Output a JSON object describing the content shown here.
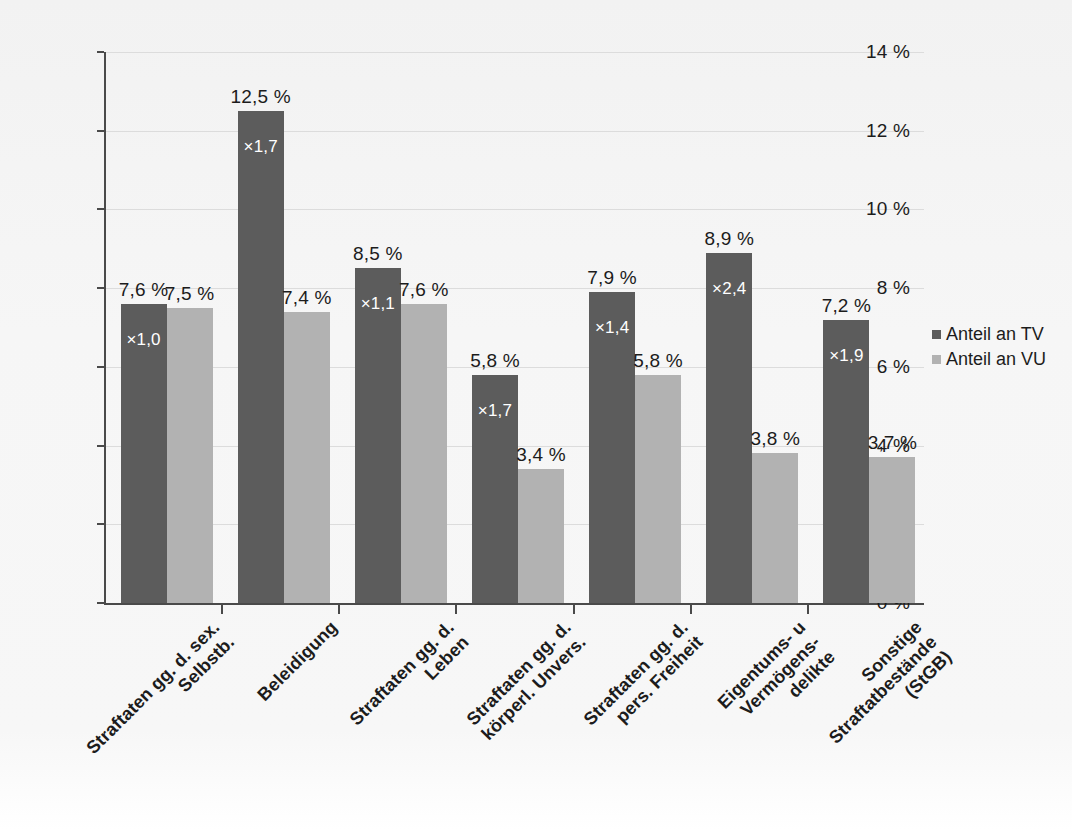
{
  "chart_data": {
    "type": "bar",
    "title": "",
    "subtitle": "",
    "xlabel": "",
    "ylabel": "",
    "ylim": [
      0,
      14
    ],
    "ytick_labels": [
      "0 %",
      "2 %",
      "4 %",
      "6 %",
      "8 %",
      "10 %",
      "12 %",
      "14 %"
    ],
    "ytick_values": [
      0,
      2,
      4,
      6,
      8,
      10,
      12,
      14
    ],
    "grid": true,
    "legend_position": "right",
    "value_suffix": " %",
    "categories": [
      [
        "Straftaten gg. d. sex.",
        "Selbstb."
      ],
      [
        "Beleidigung"
      ],
      [
        "Straftaten gg. d.",
        "Leben"
      ],
      [
        "Straftaten gg. d.",
        "körperl. Unvers."
      ],
      [
        "Straftaten gg. d.",
        "pers. Freiheit"
      ],
      [
        "Eigentums- u",
        "Vermögens-",
        "delikte"
      ],
      [
        "Sonstige",
        "Straftatbestände",
        "(StGB)"
      ]
    ],
    "series": [
      {
        "name": "Anteil an TV",
        "color": "#5c5c5c",
        "values": [
          7.6,
          12.5,
          8.5,
          5.8,
          7.9,
          8.9,
          7.2
        ],
        "value_labels": [
          "7,6 %",
          "12,5 %",
          "8,5 %",
          "5,8 %",
          "7,9 %",
          "8,9 %",
          "7,2 %"
        ],
        "inner_labels": [
          "×1,0",
          "×1,7",
          "×1,1",
          "×1,7",
          "×1,4",
          "×2,4",
          "×1,9"
        ]
      },
      {
        "name": "Anteil an VU",
        "color": "#b2b2b2",
        "values": [
          7.5,
          7.4,
          7.6,
          3.4,
          5.8,
          3.8,
          3.7
        ],
        "value_labels": [
          "7,5 %",
          "7,4 %",
          "7,6 %",
          "3,4 %",
          "5,8 %",
          "3,8 %",
          "3,7 %"
        ],
        "inner_labels": [
          "",
          "",
          "",
          "",
          "",
          "",
          ""
        ]
      }
    ]
  },
  "legend": {
    "items": [
      {
        "label": "Anteil an TV"
      },
      {
        "label": "Anteil an VU"
      }
    ]
  }
}
